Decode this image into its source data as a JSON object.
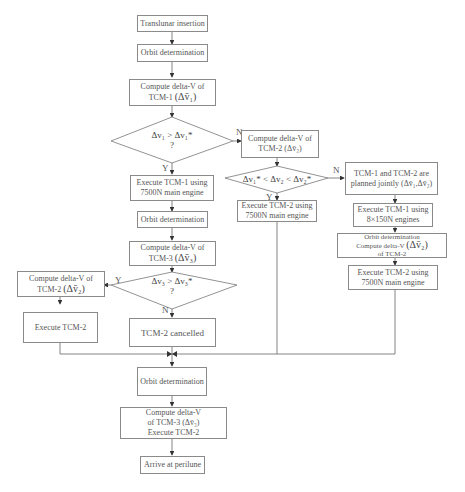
{
  "nodes": {
    "translunar": "Translunar insertion",
    "od1": "Orbit determination",
    "tcm1_compute": {
      "line1": "Compute delta-V of",
      "line2": "TCM-1",
      "math": "(Δv̄₁)"
    },
    "dec1": {
      "expr": "Δv₁ > Δv₁*",
      "q": "?"
    },
    "tcm2_compute_right": {
      "line1": "Compute delta-V of",
      "line2": "TCM-2",
      "math": "(Δv̄₂)"
    },
    "dec2": {
      "expr": "Δv₁* < Δv₂ < Δv₂*"
    },
    "exec_tcm1": {
      "line1": "Execute TCM-1 using",
      "line2": "7500N main engine"
    },
    "od2": "Orbit determination",
    "tcm3_compute": {
      "line1": "Compute delta-V of",
      "line2": "TCM-3",
      "math": "(Δv̄₃)"
    },
    "dec3": {
      "expr": "Δv₃ > Δv₃*",
      "q": "?"
    },
    "tcm2_compute_left": {
      "line1": "Compute delta-V of",
      "line2": "TCM-2",
      "math": "(Δv̄₂)"
    },
    "exec_tcm2_left": "Execute TCM-2",
    "tcm2_cancelled": "TCM-2 cancelled",
    "exec_tcm2_mid": {
      "line1": "Execute TCM-2 using",
      "line2": "7500N main engine"
    },
    "joint": {
      "line1": "TCM-1 and TCM-2 are",
      "line2": "planned jointly",
      "math": "(Δv̄₁,Δv̄₂)"
    },
    "exec_tcm1_small": {
      "line1": "Execute TCM-1 using",
      "line2": "8×150N engines"
    },
    "od_right": {
      "line1": "Orbit determination",
      "line2": "Compute delta-V",
      "line3": "of TCM-2",
      "math": "(Δv̄₂)"
    },
    "exec_tcm2_right": {
      "line1": "Execute TCM-2 using",
      "line2": "7500N main engine"
    },
    "od3": "Orbit determination",
    "tcm3_final": {
      "line1": "Compute delta-V",
      "line2": "of TCM-3  (Δv̄₃)",
      "line3": "Execute TCM-2"
    },
    "arrive": "Arrive at perilune"
  },
  "labels": {
    "dec1_no": "N",
    "dec1_yes": "Y",
    "dec2_no": "N",
    "dec2_yes": "Y",
    "dec3_yes": "Y",
    "dec3_no": "N"
  },
  "colors": {
    "line": "#555555",
    "border": "#8a8a8a"
  }
}
